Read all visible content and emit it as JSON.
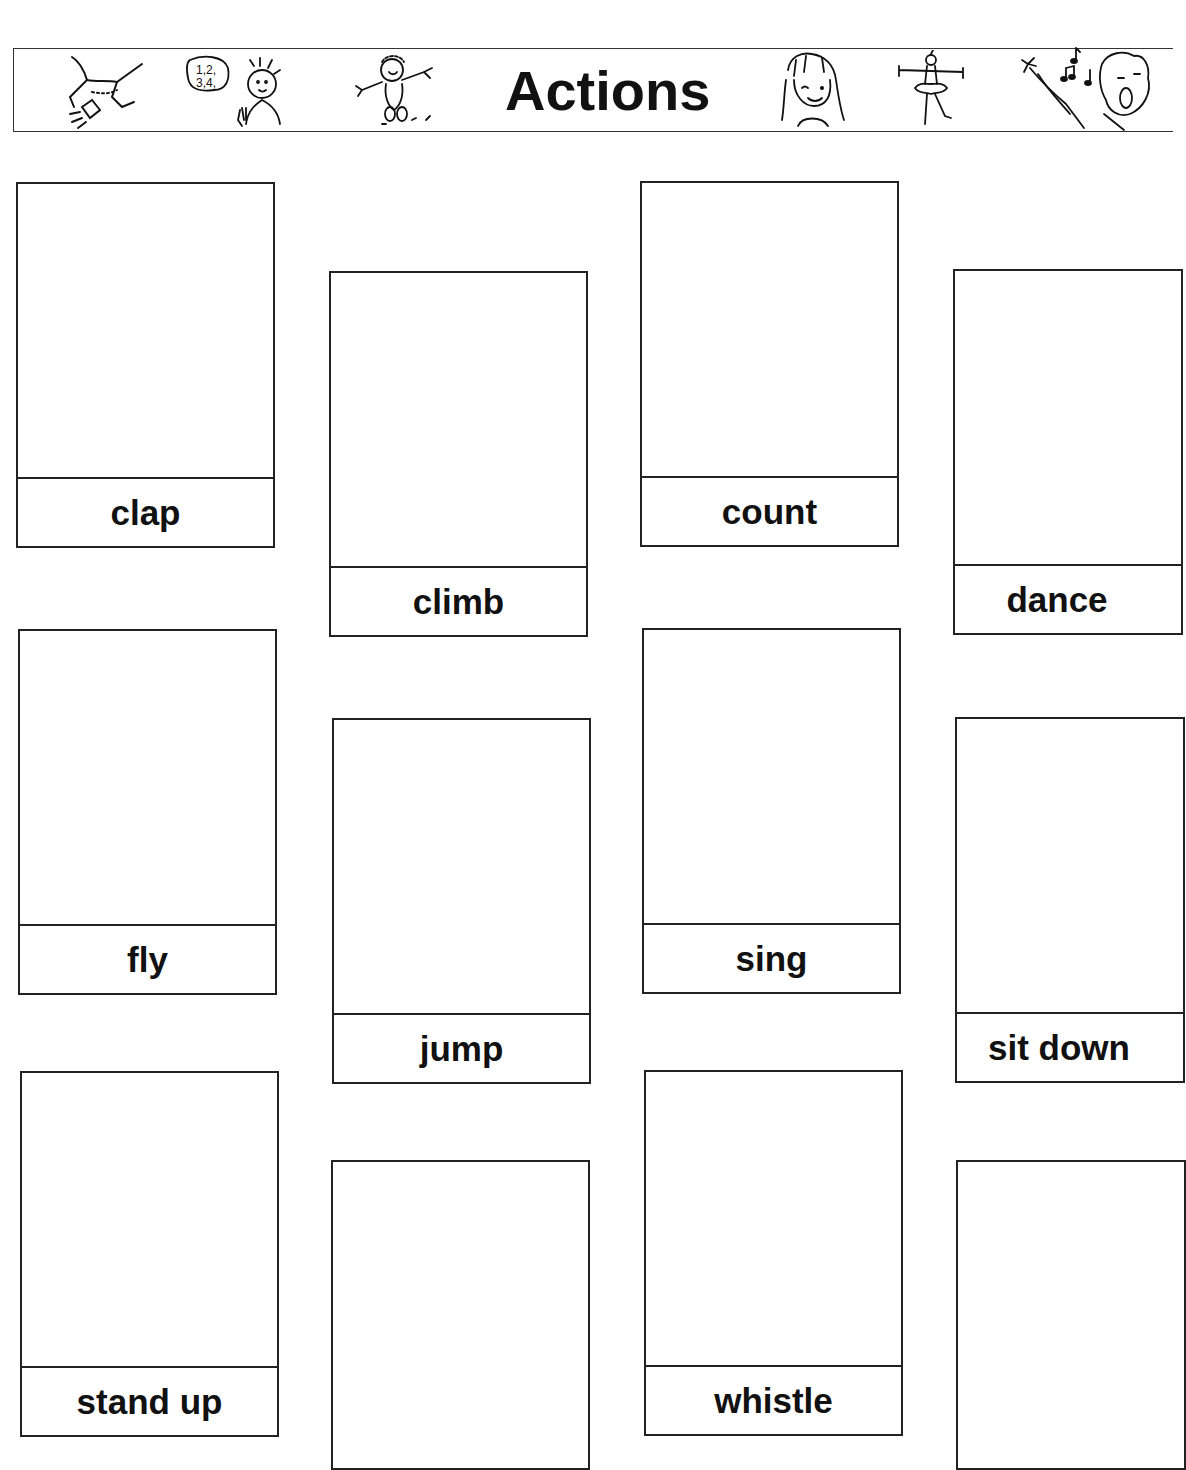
{
  "header": {
    "title": "Actions",
    "illustrations": [
      "clap-figure-icon",
      "counting-boy-icon",
      "jumping-boy-icon",
      "whistling-girl-icon",
      "ballerina-icon",
      "singing-boy-icon"
    ],
    "count_bubble_text": "1,2,\n3,4,"
  },
  "cards": [
    {
      "label": "clap"
    },
    {
      "label": "climb"
    },
    {
      "label": "count"
    },
    {
      "label": "dance"
    },
    {
      "label": "fly"
    },
    {
      "label": "jump"
    },
    {
      "label": "sing"
    },
    {
      "label": "sit down"
    },
    {
      "label": "stand up"
    },
    {
      "label": ""
    },
    {
      "label": "whistle"
    },
    {
      "label": ""
    }
  ]
}
